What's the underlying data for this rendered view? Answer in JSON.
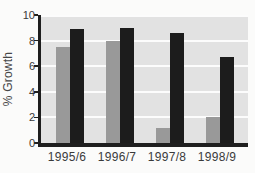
{
  "chart_data": {
    "type": "bar",
    "title": "",
    "ylabel": "% Growth",
    "xlabel": "",
    "categories": [
      "1995/6",
      "1996/7",
      "1997/8",
      "1998/9"
    ],
    "series": [
      {
        "name": "gray-series",
        "color": "#999999",
        "values": [
          7.5,
          8.0,
          1.2,
          2.0
        ]
      },
      {
        "name": "black-series",
        "color": "#1c1c1c",
        "values": [
          8.9,
          9.0,
          8.6,
          6.7
        ]
      }
    ],
    "ylim": [
      0,
      10
    ],
    "yticks": [
      0,
      2,
      4,
      6,
      8,
      10
    ],
    "grid": "horizontal-white-lines",
    "legend": "none",
    "plot_background": "#e2e2e2",
    "page_background": "#fbfbfa",
    "axis_color": "#1e1e1e",
    "tick_label_color": "#3a3a3a"
  }
}
